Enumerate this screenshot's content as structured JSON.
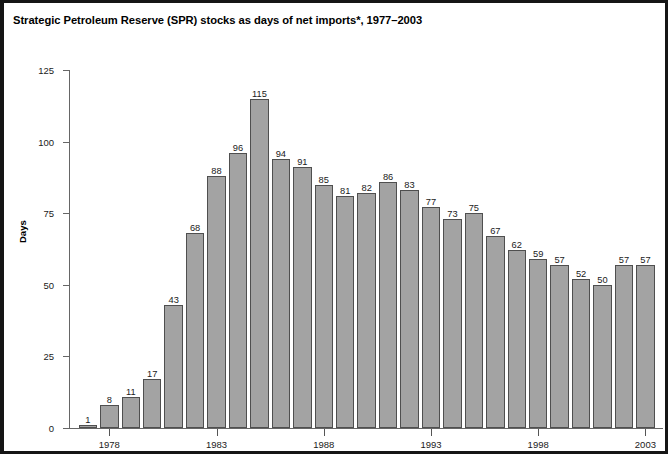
{
  "chart_title": "Strategic Petroleum Reserve (SPR) stocks as days of net imports*, 1977–2003",
  "axes": {
    "ylabel": "Days",
    "y_ticks": [
      "0",
      "25",
      "50",
      "75",
      "100",
      "125"
    ],
    "x_ticks": [
      "1978",
      "1983",
      "1988",
      "1993",
      "1998",
      "2003"
    ]
  },
  "chart_data": {
    "type": "bar",
    "title": "Strategic Petroleum Reserve (SPR) stocks as days of net imports*, 1977–2003",
    "xlabel": "",
    "ylabel": "Days",
    "ylim": [
      0,
      125
    ],
    "yticks": [
      0,
      25,
      50,
      75,
      100,
      125
    ],
    "grid": false,
    "legend": "none",
    "categories": [
      "1977",
      "1978",
      "1979",
      "1980",
      "1981",
      "1982",
      "1983",
      "1984",
      "1985",
      "1986",
      "1987",
      "1988",
      "1989",
      "1990",
      "1991",
      "1992",
      "1993",
      "1994",
      "1995",
      "1996",
      "1997",
      "1998",
      "1999",
      "2000",
      "2001",
      "2002",
      "2003"
    ],
    "values": [
      1,
      8,
      11,
      17,
      43,
      68,
      88,
      96,
      115,
      94,
      91,
      85,
      81,
      82,
      86,
      83,
      77,
      73,
      75,
      67,
      62,
      59,
      57,
      52,
      50,
      57,
      57
    ],
    "labeled_x_ticks": [
      "1978",
      "1983",
      "1988",
      "1993",
      "1998",
      "2003"
    ],
    "bar_color": "#a3a3a3",
    "bar_edge_color": "#4f4f4f"
  }
}
